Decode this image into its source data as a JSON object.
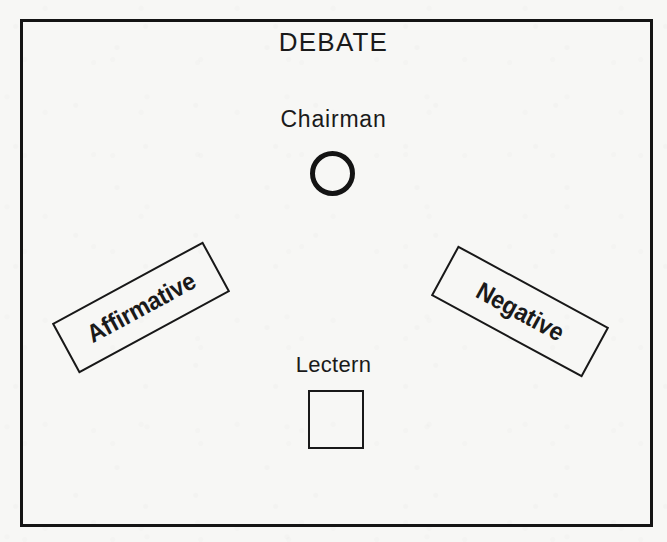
{
  "diagram": {
    "title": "DEBATE",
    "frame": {
      "name": "room-boundary",
      "border_color": "#141414"
    },
    "background_color": "#f7f7f5",
    "ink_color": "#1a1a1a",
    "elements": {
      "chairman": {
        "label": "Chairman",
        "seat_shape": "circle"
      },
      "affirmative": {
        "label": "Affirmative",
        "table_shape": "rectangle",
        "rotation_deg": -28.5
      },
      "negative": {
        "label": "Negative",
        "table_shape": "rectangle",
        "rotation_deg": 28.5
      },
      "lectern": {
        "label": "Lectern",
        "shape": "square"
      }
    }
  }
}
